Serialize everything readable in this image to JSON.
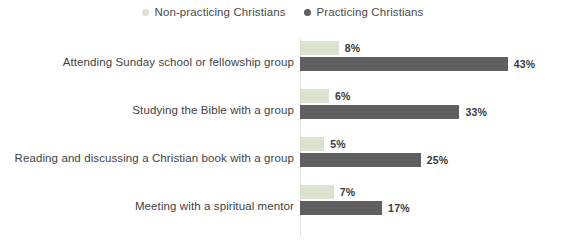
{
  "chart_data": {
    "type": "bar",
    "orientation": "horizontal",
    "title": "",
    "subtitle": "",
    "xlabel": "",
    "ylabel": "",
    "grid": false,
    "legend_position": "top-center",
    "xlim": [
      0,
      55
    ],
    "axis_line": true,
    "value_suffix": "%",
    "categories": [
      "Attending Sunday school or fellowship group",
      "Studying the Bible with a group",
      "Reading and discussing a Christian book with a group",
      "Meeting with a spiritual mentor"
    ],
    "series": [
      {
        "name": "Non-practicing Christians",
        "color": "#d9e3cd",
        "values": [
          8,
          6,
          5,
          7
        ],
        "labels": [
          "8%",
          "6%",
          "5%",
          "7%"
        ]
      },
      {
        "name": "Practicing Christians",
        "color": "#5f5f5f",
        "values": [
          43,
          33,
          25,
          17
        ],
        "labels": [
          "43%",
          "33%",
          "25%",
          "17%"
        ]
      }
    ]
  },
  "scale": {
    "px_per_percent": 4.83
  }
}
